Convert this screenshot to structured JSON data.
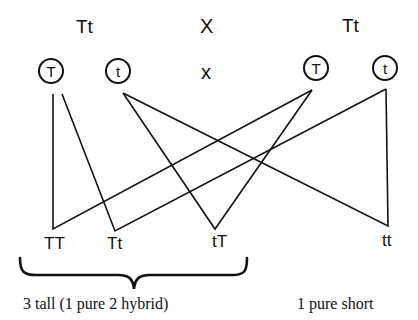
{
  "parents": {
    "left": "Tt",
    "cross": "X",
    "right": "Tt"
  },
  "gametes": {
    "left": [
      "T",
      "t"
    ],
    "cross": "x",
    "right": [
      "T",
      "t"
    ]
  },
  "offspring": [
    "TT",
    "Tt",
    "tT",
    "tt"
  ],
  "captions": {
    "tall": "3 tall (1 pure 2 hybrid)",
    "short": "1 pure short"
  },
  "colors": {
    "ink": "#111111",
    "background": "#ffffff"
  }
}
